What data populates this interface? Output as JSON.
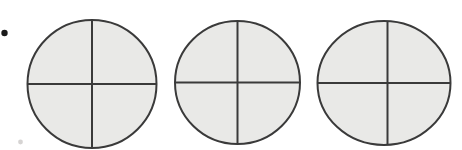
{
  "figure": {
    "title": "Three circles each divided into four equal quarters",
    "width": 462,
    "height": 150,
    "background_color": "#ffffff",
    "stroke_color": "#3a3a3a",
    "fill_color": "#e9e9e7",
    "outline_width": 2,
    "divider_width": 2,
    "shape_label": "circle",
    "divisions_per_circle": 4,
    "shaded_parts_per_circle": 4,
    "fraction_text": "4/4"
  },
  "chart_data": {
    "type": "pie",
    "title": "Three circles each divided into four equal quarters",
    "xlabel": "",
    "ylabel": "",
    "legend_position": "none",
    "grid": false,
    "categories": [
      "quarter 1",
      "quarter 2",
      "quarter 3",
      "quarter 4"
    ],
    "values": [
      25,
      25,
      25,
      25
    ],
    "series": [
      {
        "name": "circle 1",
        "values": [
          25,
          25,
          25,
          25
        ]
      },
      {
        "name": "circle 2",
        "values": [
          25,
          25,
          25,
          25
        ]
      },
      {
        "name": "circle 3",
        "values": [
          25,
          25,
          25,
          25
        ]
      }
    ],
    "annotations": []
  },
  "circles": [
    {
      "id": "circle-1",
      "label": "circle 1",
      "cx": 92,
      "cy": 84,
      "rx": 64.5,
      "ry": 64,
      "parts": 4,
      "shaded": 4
    },
    {
      "id": "circle-2",
      "label": "circle 2",
      "cx": 237.5,
      "cy": 82.5,
      "rx": 62.5,
      "ry": 61.5,
      "parts": 4,
      "shaded": 4
    },
    {
      "id": "circle-3",
      "label": "circle 3",
      "cx": 384,
      "cy": 83,
      "rx": 66.5,
      "ry": 62,
      "parts": 4,
      "shaded": 4
    }
  ],
  "marks": [
    {
      "id": "scan-dot",
      "label": "dot",
      "cx": 4.5,
      "cy": 33,
      "r": 3.2,
      "color": "#1a1a1a",
      "opacity": 1
    },
    {
      "id": "scan-speck",
      "label": "speck",
      "cx": 20.5,
      "cy": 142,
      "r": 2.4,
      "color": "#c8c6c4",
      "opacity": 0.75
    }
  ]
}
